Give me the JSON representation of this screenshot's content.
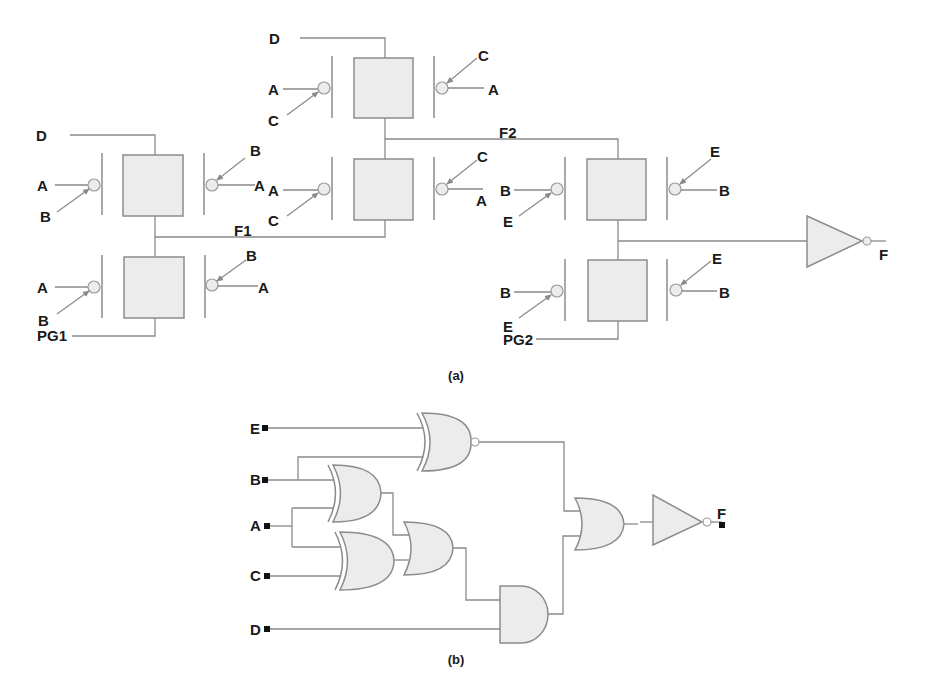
{
  "figure": {
    "panel_a": {
      "caption": "(a)",
      "description": "Pass-transistor gate network implementation",
      "stage1": {
        "top_input": "D",
        "top_left": {
          "in": "A",
          "ctrl": "B"
        },
        "top_right": {
          "ctrl": "B",
          "in": "A"
        },
        "bottom_left": {
          "in": "A",
          "ctrl": "B"
        },
        "bottom_right": {
          "ctrl": "B",
          "in": "A"
        },
        "bottom_input": "PG1",
        "output": "F1"
      },
      "stage2": {
        "top_input": "D",
        "top_left": {
          "in": "A",
          "ctrl": "C"
        },
        "top_right": {
          "ctrl": "C",
          "in": "A"
        },
        "bottom_left": {
          "in": "A",
          "ctrl": "C"
        },
        "bottom_right": {
          "ctrl": "C",
          "in": "A"
        },
        "output": "F2"
      },
      "stage3": {
        "top_left": {
          "in": "B",
          "ctrl": "E"
        },
        "top_right": {
          "ctrl": "E",
          "in": "B"
        },
        "bottom_left": {
          "in": "B",
          "ctrl": "E"
        },
        "bottom_right": {
          "ctrl": "E",
          "in": "B"
        },
        "bottom_input": "PG2"
      },
      "output": "F"
    },
    "panel_b": {
      "caption": "(b)",
      "description": "Equivalent logic gate circuit",
      "inputs": [
        "E",
        "B",
        "A",
        "C",
        "D"
      ],
      "gates": [
        "XNOR(E,B)",
        "XOR(B,A)",
        "XOR(A,C)",
        "OR",
        "AND(OR,D)",
        "OR",
        "NOT"
      ],
      "output": "F"
    }
  }
}
